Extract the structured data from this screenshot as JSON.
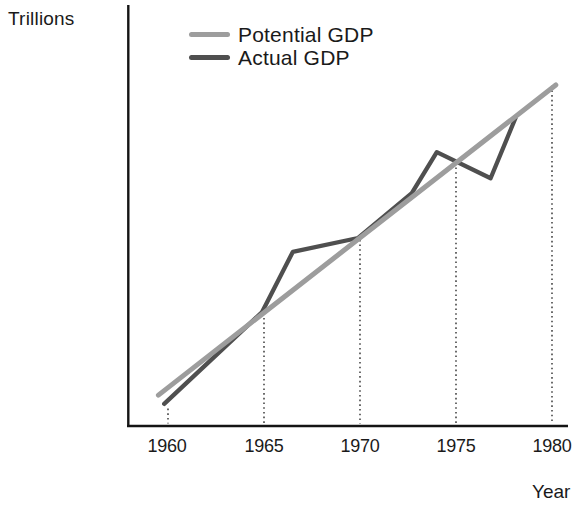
{
  "chart_data": {
    "type": "line",
    "ylabel": "Trillions",
    "xlabel": "Year",
    "x_ticks": [
      "1960",
      "1965",
      "1970",
      "1975",
      "1980"
    ],
    "x_tick_years": [
      1960,
      1965,
      1970,
      1975,
      1980
    ],
    "xlim": [
      1958.5,
      1981.5
    ],
    "ylim": [
      0,
      115
    ],
    "y_scale_note": "y axis has no numeric ticks; values are relative levels on a 0-115 scale of the unlabeled axis",
    "grid": false,
    "legend_position": "top-left-inside",
    "series": [
      {
        "name": "Potential GDP",
        "color": "#9d9d9d",
        "points": [
          {
            "x": 1959.5,
            "y": 8.7
          },
          {
            "x": 1980.2,
            "y": 93.2
          }
        ]
      },
      {
        "name": "Actual GDP",
        "color": "#4f4f4f",
        "points": [
          {
            "x": 1959.8,
            "y": 6.3
          },
          {
            "x": 1964.9,
            "y": 31.3
          },
          {
            "x": 1966.5,
            "y": 47.7
          },
          {
            "x": 1969.9,
            "y": 51.5
          },
          {
            "x": 1972.7,
            "y": 63.7
          },
          {
            "x": 1974.0,
            "y": 74.9
          },
          {
            "x": 1976.8,
            "y": 67.8
          },
          {
            "x": 1978.1,
            "y": 84.2
          }
        ]
      }
    ],
    "guides": [
      {
        "year": 1960,
        "level": 5
      },
      {
        "year": 1965,
        "level": 31
      },
      {
        "year": 1970,
        "level": 51
      },
      {
        "year": 1975,
        "level": 72
      },
      {
        "year": 1980,
        "level": 93
      }
    ]
  }
}
